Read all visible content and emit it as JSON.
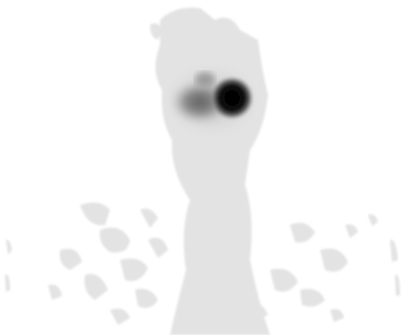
{
  "image": {
    "kind": "grayscale scintigraphy scan",
    "width": 410,
    "height": 335,
    "background": "#ffffff",
    "colors": {
      "background_tissue": "#e4e4e4",
      "mid_uptake": "#b0b0b0",
      "hot_spot": "#0a0a0a"
    },
    "regions": [
      {
        "name": "hot-nodule",
        "cx": 232,
        "cy": 98,
        "r": 16
      },
      {
        "name": "diffuse-uptake",
        "cx": 200,
        "cy": 100,
        "rx": 30,
        "ry": 22
      }
    ]
  }
}
